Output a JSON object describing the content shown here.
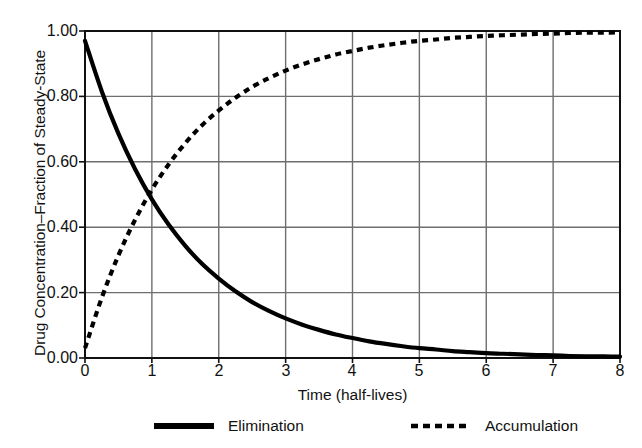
{
  "chart_data": {
    "type": "line",
    "title": "",
    "xlabel": "Time (half-lives)",
    "ylabel": "Drug Concentration–Fraction of Steady-State",
    "xlim": [
      0,
      8
    ],
    "ylim": [
      0.0,
      1.0
    ],
    "grid": true,
    "legend_position": "below",
    "x_ticks": [
      "0",
      "1",
      "2",
      "3",
      "4",
      "5",
      "6",
      "7",
      "8"
    ],
    "y_ticks": [
      "0.00",
      "0.20",
      "0.40",
      "0.60",
      "0.80",
      "1.00"
    ],
    "x": [
      0,
      0.25,
      0.5,
      0.75,
      1,
      1.25,
      1.5,
      1.75,
      2,
      2.25,
      2.5,
      2.75,
      3,
      3.25,
      3.5,
      3.75,
      4,
      4.25,
      4.5,
      4.75,
      5,
      5.25,
      5.5,
      5.75,
      6,
      6.25,
      6.5,
      6.75,
      7,
      7.25,
      7.5,
      7.75,
      8
    ],
    "series": [
      {
        "name": "Elimination",
        "style": "solid",
        "color": "#000000",
        "width": 4.2,
        "values": [
          0.97,
          0.816,
          0.686,
          0.577,
          0.485,
          0.408,
          0.343,
          0.288,
          0.243,
          0.204,
          0.171,
          0.144,
          0.121,
          0.102,
          0.086,
          0.072,
          0.061,
          0.051,
          0.043,
          0.036,
          0.03,
          0.026,
          0.021,
          0.018,
          0.015,
          0.013,
          0.011,
          0.009,
          0.008,
          0.006,
          0.005,
          0.005,
          0.004
        ]
      },
      {
        "name": "Accumulation",
        "style": "dashed",
        "color": "#000000",
        "width": 4.2,
        "values": [
          0.03,
          0.184,
          0.314,
          0.423,
          0.515,
          0.592,
          0.657,
          0.712,
          0.757,
          0.796,
          0.829,
          0.856,
          0.879,
          0.898,
          0.914,
          0.928,
          0.939,
          0.949,
          0.957,
          0.964,
          0.97,
          0.974,
          0.979,
          0.982,
          0.985,
          0.987,
          0.989,
          0.991,
          0.992,
          0.994,
          0.995,
          0.995,
          0.996
        ]
      }
    ],
    "annotations": []
  },
  "legend": {
    "entries": [
      {
        "label": "Elimination",
        "swatch": "solid-line-swatch"
      },
      {
        "label": "Accumulation",
        "swatch": "dashed-line-swatch"
      }
    ]
  },
  "axes": {
    "x_title": "Time (half-lives)",
    "y_title": "Drug Concentration–Fraction of Steady-State",
    "x_tick_labels": [
      "0",
      "1",
      "2",
      "3",
      "4",
      "5",
      "6",
      "7",
      "8"
    ],
    "y_tick_labels": [
      "1.00",
      "0.80",
      "0.60",
      "0.40",
      "0.20",
      "0.00"
    ]
  },
  "colors": {
    "line": "#000000",
    "grid": "#6e6e6e",
    "axis": "#111111",
    "background": "#ffffff"
  }
}
